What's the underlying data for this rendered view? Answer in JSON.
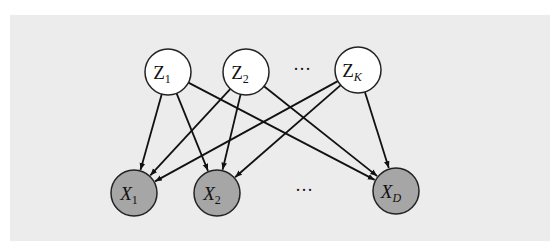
{
  "diagram": {
    "title": "",
    "type": "bipartite-graphical-model",
    "colors": {
      "panel": "#ececec",
      "latent_fill": "#ffffff",
      "observed_fill": "#a6a6a6",
      "stroke": "#111111"
    },
    "latent_nodes": [
      {
        "id": "Z1",
        "base": "Z",
        "sub": "1",
        "italic": false,
        "cx": 168,
        "cy": 72
      },
      {
        "id": "Z2",
        "base": "Z",
        "sub": "2",
        "italic": false,
        "cx": 246,
        "cy": 72
      },
      {
        "id": "ZK",
        "base": "Z",
        "sub": "K",
        "italic": false,
        "cx": 358,
        "cy": 70
      }
    ],
    "latent_ellipsis": {
      "text": "···",
      "x": 302,
      "y": 75
    },
    "observed_nodes": [
      {
        "id": "X1",
        "base": "X",
        "sub": "1",
        "italic": true,
        "cx": 134,
        "cy": 193
      },
      {
        "id": "X2",
        "base": "X",
        "sub": "2",
        "italic": true,
        "cx": 217,
        "cy": 193
      },
      {
        "id": "XD",
        "base": "X",
        "sub": "D",
        "italic": true,
        "cx": 396,
        "cy": 191
      }
    ],
    "observed_ellipsis": {
      "text": "···",
      "x": 304,
      "y": 196
    },
    "node_radius": 23,
    "edges": [
      [
        "Z1",
        "X1"
      ],
      [
        "Z1",
        "X2"
      ],
      [
        "Z1",
        "XD"
      ],
      [
        "Z2",
        "X1"
      ],
      [
        "Z2",
        "X2"
      ],
      [
        "Z2",
        "XD"
      ],
      [
        "ZK",
        "X1"
      ],
      [
        "ZK",
        "X2"
      ],
      [
        "ZK",
        "XD"
      ]
    ]
  },
  "labels": {
    "z1_base": "Z",
    "z1_sub": "1",
    "z2_base": "Z",
    "z2_sub": "2",
    "zk_base": "Z",
    "zk_sub": "K",
    "x1_base": "X",
    "x1_sub": "1",
    "x2_base": "X",
    "x2_sub": "2",
    "xd_base": "X",
    "xd_sub": "D",
    "top_ellipsis": "···",
    "bottom_ellipsis": "···"
  }
}
